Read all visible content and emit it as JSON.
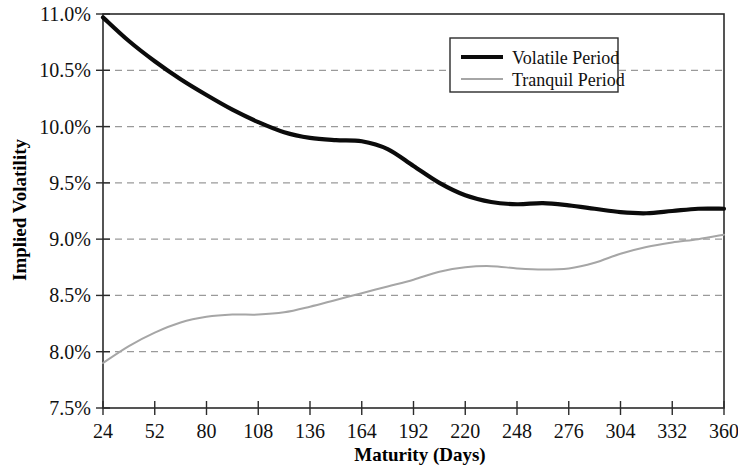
{
  "chart_data": {
    "type": "line",
    "title": "",
    "xlabel": "Maturity (Days)",
    "ylabel": "Implied Volatility",
    "xlim": [
      24,
      360
    ],
    "ylim": [
      7.5,
      11.0
    ],
    "grid": true,
    "legend_position": "top-right",
    "x_ticks": [
      "24",
      "52",
      "80",
      "108",
      "136",
      "164",
      "192",
      "220",
      "248",
      "276",
      "304",
      "332",
      "360"
    ],
    "y_ticks": [
      "7.5%",
      "8.0%",
      "8.5%",
      "9.0%",
      "9.5%",
      "10.0%",
      "10.5%",
      "11.0%"
    ],
    "x": [
      24,
      38,
      52,
      66,
      80,
      94,
      108,
      122,
      136,
      150,
      164,
      178,
      192,
      206,
      220,
      234,
      248,
      262,
      276,
      290,
      304,
      318,
      332,
      346,
      360
    ],
    "series": [
      {
        "name": "Volatile Period",
        "color": "#0b0b0b",
        "width": "thick",
        "values": [
          10.97,
          10.76,
          10.58,
          10.42,
          10.28,
          10.15,
          10.04,
          9.95,
          9.9,
          9.88,
          9.87,
          9.8,
          9.65,
          9.5,
          9.39,
          9.33,
          9.31,
          9.32,
          9.3,
          9.27,
          9.24,
          9.23,
          9.25,
          9.27,
          9.27
        ]
      },
      {
        "name": "Tranquil Period",
        "color": "#a6a6a6",
        "width": "thin",
        "values": [
          7.9,
          8.05,
          8.17,
          8.26,
          8.31,
          8.33,
          8.33,
          8.35,
          8.4,
          8.46,
          8.52,
          8.58,
          8.64,
          8.71,
          8.75,
          8.76,
          8.74,
          8.73,
          8.74,
          8.79,
          8.87,
          8.93,
          8.97,
          9.0,
          9.04
        ]
      }
    ]
  },
  "legend": {
    "entries": [
      {
        "label": "Volatile Period"
      },
      {
        "label": "Tranquil Period"
      }
    ]
  },
  "axes": {
    "y_title": "Implied Volatility",
    "x_title": "Maturity (Days)"
  }
}
